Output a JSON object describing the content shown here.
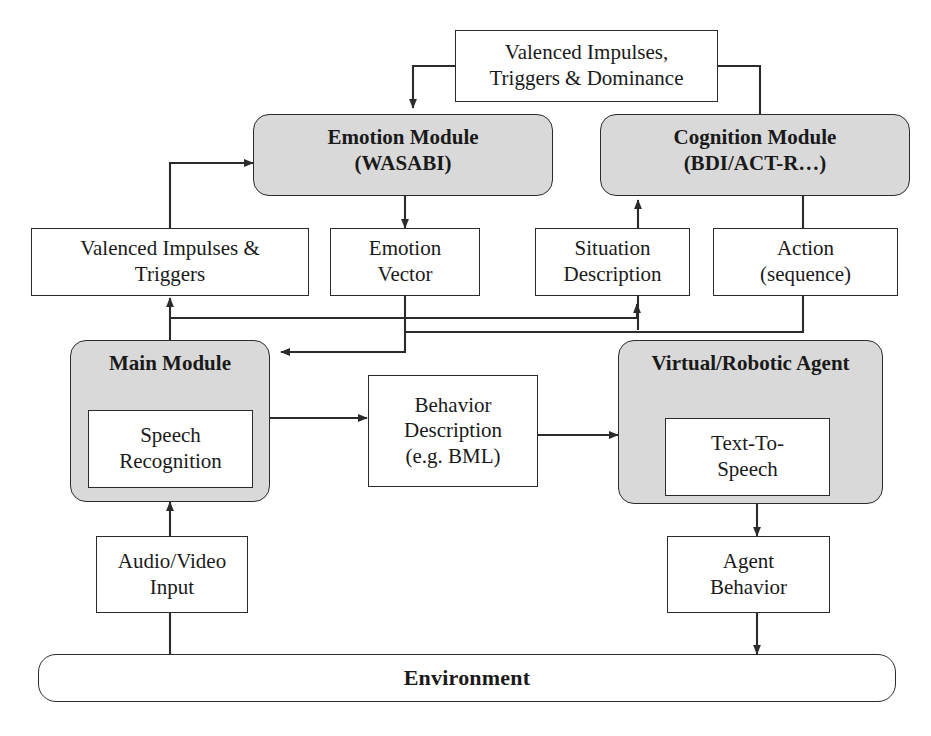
{
  "diagram": {
    "style": {
      "module_fill": "#d9d9d9",
      "box_fill": "#ffffff",
      "stroke": "#2b2b2b",
      "background": "#ffffff"
    },
    "nodes": {
      "valenced_top": {
        "label": "Valenced Impulses,\nTriggers & Dominance",
        "kind": "box"
      },
      "emotion_module": {
        "label": "Emotion Module\n(WASABI)",
        "kind": "module"
      },
      "cognition_module": {
        "label": "Cognition Module\n(BDI/ACT-R…)",
        "kind": "module"
      },
      "valenced_triggers": {
        "label": "Valenced Impulses &\nTriggers",
        "kind": "box"
      },
      "emotion_vector": {
        "label": "Emotion\nVector",
        "kind": "box"
      },
      "situation_description": {
        "label": "Situation\nDescription",
        "kind": "box"
      },
      "action_sequence": {
        "label": "Action\n(sequence)",
        "kind": "box"
      },
      "main_module": {
        "label": "Main Module",
        "kind": "module"
      },
      "speech_recognition": {
        "label": "Speech\nRecognition",
        "kind": "inner-box"
      },
      "behavior_description": {
        "label": "Behavior\nDescription\n(e.g. BML)",
        "kind": "box"
      },
      "virtual_agent": {
        "label": "Virtual/Robotic Agent",
        "kind": "module"
      },
      "text_to_speech": {
        "label": "Text-To-\nSpeech",
        "kind": "inner-box"
      },
      "audio_video_input": {
        "label": "Audio/Video\nInput",
        "kind": "box"
      },
      "agent_behavior": {
        "label": "Agent\nBehavior",
        "kind": "box"
      },
      "environment": {
        "label": "Environment",
        "kind": "bar"
      }
    },
    "edges": [
      {
        "from": "valenced_top",
        "to": "emotion_module",
        "arrow": true
      },
      {
        "from": "valenced_top",
        "to": "cognition_module",
        "arrow": false
      },
      {
        "from": "valenced_triggers",
        "to": "emotion_module",
        "arrow": true
      },
      {
        "from": "emotion_module",
        "to": "emotion_vector",
        "arrow": true
      },
      {
        "from": "situation_description",
        "to": "cognition_module",
        "arrow": true
      },
      {
        "from": "cognition_module",
        "to": "action_sequence",
        "arrow": false
      },
      {
        "from": "main_module",
        "to": "valenced_triggers",
        "arrow": true
      },
      {
        "from": "main_module",
        "to": "situation_description",
        "arrow": true
      },
      {
        "from": "emotion_vector",
        "to": "main_module",
        "arrow": true
      },
      {
        "from": "action_sequence",
        "to": "main_module",
        "arrow": false
      },
      {
        "from": "main_module",
        "to": "behavior_description",
        "arrow": true
      },
      {
        "from": "behavior_description",
        "to": "virtual_agent",
        "arrow": true
      },
      {
        "from": "environment",
        "to": "audio_video_input",
        "arrow": false
      },
      {
        "from": "audio_video_input",
        "to": "main_module",
        "arrow": true
      },
      {
        "from": "virtual_agent",
        "to": "agent_behavior",
        "arrow": true
      },
      {
        "from": "agent_behavior",
        "to": "environment",
        "arrow": true
      }
    ]
  }
}
